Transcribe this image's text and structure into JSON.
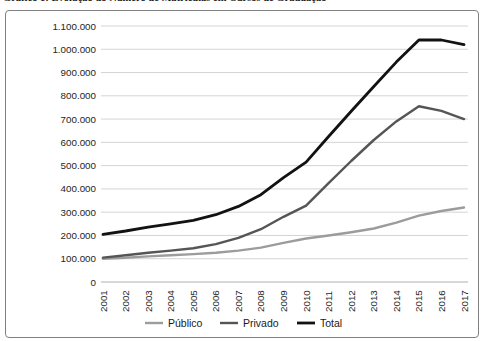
{
  "title": {
    "text": "Gráfico 1: Evolução do Número de Matrículas em Cursos de Graduação"
  },
  "chart_data": {
    "type": "line",
    "x": [
      2001,
      2002,
      2003,
      2004,
      2005,
      2006,
      2007,
      2008,
      2009,
      2010,
      2011,
      2012,
      2013,
      2014,
      2015,
      2016,
      2017
    ],
    "series": [
      {
        "name": "Público",
        "color": "#9c9c9c",
        "stroke_width": 2.4,
        "values": [
          100000,
          104000,
          110000,
          115000,
          120000,
          126000,
          135000,
          148000,
          168000,
          187000,
          200000,
          214000,
          230000,
          255000,
          285000,
          305000,
          320000
        ]
      },
      {
        "name": "Privado",
        "color": "#555555",
        "stroke_width": 2.4,
        "values": [
          105000,
          115000,
          126000,
          135000,
          145000,
          163000,
          190000,
          227000,
          280000,
          328000,
          425000,
          520000,
          610000,
          690000,
          755000,
          735000,
          700000
        ]
      },
      {
        "name": "Total",
        "color": "#121212",
        "stroke_width": 2.8,
        "values": [
          205000,
          219000,
          236000,
          250000,
          265000,
          289000,
          325000,
          375000,
          448000,
          515000,
          625000,
          734000,
          840000,
          945000,
          1040000,
          1040000,
          1020000
        ]
      }
    ],
    "ylim": [
      0,
      1100000
    ],
    "y_tick_step": 100000,
    "y_tick_labels": [
      "0",
      "100.000",
      "200.000",
      "300.000",
      "400.000",
      "500.000",
      "600.000",
      "700.000",
      "800.000",
      "900.000",
      "1.000.000",
      "1.100.000"
    ],
    "x_tick_labels": [
      "2001",
      "2002",
      "2003",
      "2004",
      "2005",
      "2006",
      "2007",
      "2008",
      "2009",
      "2010",
      "2011",
      "2012",
      "2013",
      "2014",
      "2015",
      "2016",
      "2017"
    ],
    "grid": "horizontal",
    "legend_position": "bottom",
    "legend": [
      "Público",
      "Privado",
      "Total"
    ]
  },
  "style": {
    "grid_color": "#d4d4d4",
    "axis_color": "#b0b0b0",
    "label_color": "#262626",
    "frame_border_color": "#7f7f7f"
  }
}
